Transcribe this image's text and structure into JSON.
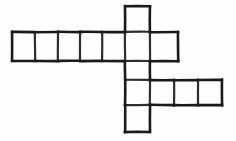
{
  "figure": {
    "type": "line-drawing",
    "alt_text": "A figure made of connected unit squares: a vertical column of five squares crossed by a horizontal row of seven squares near the top and a horizontal row of four squares lower down."
  },
  "canvas": {
    "width": 236,
    "height": 141,
    "background_color": "#fefefe"
  },
  "style": {
    "stroke_color": "#1a1a1a",
    "stroke_color_light": "#2e2e2e",
    "fill_color": "#fdfdfd",
    "stroke_width": 2.6,
    "stroke_width_inner": 2.2
  },
  "geometry": {
    "grid_x": [
      12,
      35,
      58,
      80,
      102,
      125,
      150,
      174,
      198,
      222
    ],
    "grid_y": [
      6,
      32,
      61,
      80,
      105,
      132
    ],
    "cell_width": 23,
    "cell_height": 26
  },
  "cells": [
    {
      "id": "r1c1",
      "name": "top-row-cell-1",
      "x": 12,
      "y": 32,
      "w": 23,
      "h": 29
    },
    {
      "id": "r1c2",
      "name": "top-row-cell-2",
      "x": 35,
      "y": 32,
      "w": 23,
      "h": 29
    },
    {
      "id": "r1c3",
      "name": "top-row-cell-3",
      "x": 58,
      "y": 32,
      "w": 22,
      "h": 29
    },
    {
      "id": "r1c4",
      "name": "top-row-cell-4",
      "x": 80,
      "y": 32,
      "w": 22,
      "h": 29
    },
    {
      "id": "r1c5",
      "name": "top-row-cell-5",
      "x": 102,
      "y": 32,
      "w": 23,
      "h": 29
    },
    {
      "id": "r1c6",
      "name": "top-row-cell-6-junction",
      "x": 125,
      "y": 32,
      "w": 25,
      "h": 29
    },
    {
      "id": "r1c7",
      "name": "top-row-cell-7",
      "x": 150,
      "y": 32,
      "w": 28,
      "h": 29
    },
    {
      "id": "col-top",
      "name": "column-cell-top",
      "x": 125,
      "y": 6,
      "w": 25,
      "h": 26
    },
    {
      "id": "col-mid",
      "name": "column-cell-middle",
      "x": 125,
      "y": 61,
      "w": 25,
      "h": 19
    },
    {
      "id": "r2c1",
      "name": "bottom-row-cell-1-junction",
      "x": 125,
      "y": 80,
      "w": 25,
      "h": 25
    },
    {
      "id": "r2c2",
      "name": "bottom-row-cell-2",
      "x": 150,
      "y": 80,
      "w": 24,
      "h": 25
    },
    {
      "id": "r2c3",
      "name": "bottom-row-cell-3",
      "x": 174,
      "y": 80,
      "w": 24,
      "h": 25
    },
    {
      "id": "r2c4",
      "name": "bottom-row-cell-4",
      "x": 198,
      "y": 80,
      "w": 24,
      "h": 25
    },
    {
      "id": "col-bot",
      "name": "column-cell-bottom",
      "x": 125,
      "y": 105,
      "w": 25,
      "h": 27
    }
  ],
  "counts": {
    "total_squares": 14,
    "top_row_squares": 7,
    "bottom_row_squares": 4,
    "column_squares": 5
  },
  "labels": {
    "none": ""
  }
}
